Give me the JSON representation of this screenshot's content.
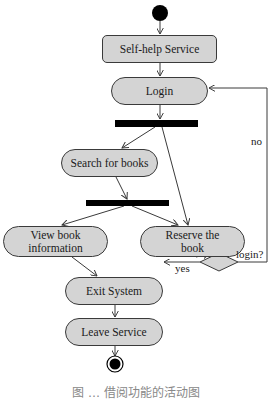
{
  "diagram": {
    "type": "UML activity diagram",
    "colors": {
      "node_fill": "#d4d4d4",
      "stroke": "#3a3a3a",
      "bar": "#000000",
      "background": "#ffffff"
    },
    "nodes": {
      "start": {
        "kind": "initial"
      },
      "self_help": {
        "label": "Self-help Service"
      },
      "login": {
        "label": "Login"
      },
      "fork1": {
        "kind": "fork-bar"
      },
      "search": {
        "label": "Search for books"
      },
      "fork2": {
        "kind": "fork-bar"
      },
      "view_info": {
        "label_line1": "View book",
        "label_line2": "information"
      },
      "reserve": {
        "label_line1": "Reserve the",
        "label_line2": "book"
      },
      "decision": {
        "kind": "decision",
        "label": "login?"
      },
      "exit": {
        "label": "Exit System"
      },
      "leave": {
        "label": "Leave Service"
      },
      "end": {
        "kind": "final"
      }
    },
    "edges": [
      {
        "from": "start",
        "to": "self_help"
      },
      {
        "from": "self_help",
        "to": "login"
      },
      {
        "from": "login",
        "to": "fork1"
      },
      {
        "from": "fork1",
        "to": "search"
      },
      {
        "from": "fork1",
        "to": "reserve"
      },
      {
        "from": "search",
        "to": "fork2"
      },
      {
        "from": "fork2",
        "to": "view_info"
      },
      {
        "from": "fork2",
        "to": "reserve"
      },
      {
        "from": "view_info",
        "to": "exit"
      },
      {
        "from": "reserve",
        "to": "decision"
      },
      {
        "from": "decision",
        "to": "exit",
        "guard": "yes"
      },
      {
        "from": "decision",
        "to": "login",
        "guard": "no"
      },
      {
        "from": "exit",
        "to": "leave"
      },
      {
        "from": "leave",
        "to": "end"
      }
    ],
    "guards": {
      "yes": "yes",
      "no": "no"
    }
  },
  "caption": {
    "text": "图 … 借阅功能的活动图"
  }
}
